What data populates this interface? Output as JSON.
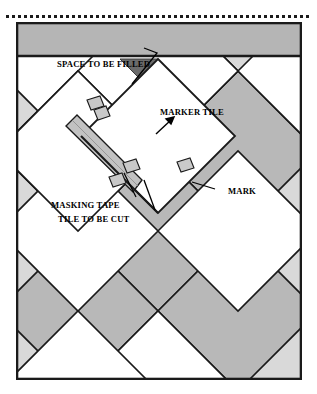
{
  "figure": {
    "type": "technical-illustration",
    "labels": {
      "space_to_be_filled": "SPACE TO BE FILLED",
      "marker_tile": "MARKER TILE",
      "mark": "MARK",
      "masking_tape": "MASKING TAPE",
      "tile_to_be_cut": "TILE TO BE CUT"
    },
    "colors": {
      "page_background": "#ffffff",
      "frame_border": "#1a1a1a",
      "wall_band": "#b5b5b5",
      "floor_background": "#d9d9d9",
      "tile_shaded": "#b8b8b8",
      "tile_white": "#ffffff",
      "gap_dark": "#6b6b6b",
      "tape_fill": "#c2c2c2",
      "leader_line": "#000000",
      "dotted_rule": "#1a1a1a"
    },
    "dotted_rule": {
      "dot_count": 51,
      "dot_size_px": 3
    }
  }
}
